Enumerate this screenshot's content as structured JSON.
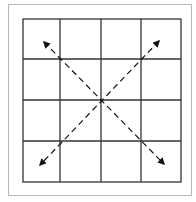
{
  "diagram": {
    "grid": {
      "rows": 4,
      "cols": 4,
      "x": 23,
      "y": 19,
      "width": 158,
      "height": 163,
      "line_color": "#333333"
    },
    "arrows": [
      {
        "name": "diagonal-nw-se",
        "from": [
          42,
          40
        ],
        "to": [
          166,
          166
        ],
        "style": "dashed",
        "heads": "both"
      },
      {
        "name": "diagonal-ne-sw",
        "from": [
          161,
          39
        ],
        "to": [
          38,
          167
        ],
        "style": "dashed",
        "heads": "both"
      }
    ],
    "frame_color": "#b8b8b8"
  }
}
